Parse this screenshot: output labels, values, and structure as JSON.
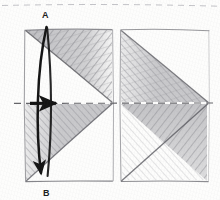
{
  "figure": {
    "kind": "pencil-sketch-fold-diagram",
    "title_visible": false,
    "background_color": "#fdfdfc",
    "ink_color": "#1d1d1d",
    "pencil_shade_color": "#8e8e93",
    "paper_texture": "graph-paper-pencil"
  },
  "labels": {
    "vertex_a": "A",
    "vertex_b": "B"
  },
  "shapes": {
    "left_square": {
      "name": "left-square",
      "x": 24,
      "y": 29,
      "width": 89,
      "height": 153,
      "diagonals": [
        "top-left-to-mid-right",
        "mid-right-to-bottom-left"
      ],
      "shaded_regions": [
        "upper-right-triangle",
        "lower-left-wedge"
      ]
    },
    "right_square": {
      "name": "right-square",
      "x": 120,
      "y": 29,
      "width": 89,
      "height": 153,
      "diagonals": [
        "top-left-to-mid-right",
        "mid-right-to-bottom-left"
      ],
      "shaded_regions": [
        "upper-left-triangle",
        "lower-right-triangle"
      ]
    }
  },
  "guides": {
    "top_dashed_line": {
      "y": 5,
      "style": "dashed"
    },
    "center_dashed_line": {
      "y": 103,
      "style": "dashed"
    }
  },
  "arrows": {
    "fold_arrow": {
      "name": "curved-fold-arrow",
      "from": "A",
      "to": "B",
      "style": "curved-solid-arrow",
      "direction": "downward"
    },
    "direction_arrow": {
      "name": "right-pointing-arrow",
      "style": "straight-solid-arrow",
      "direction": "right",
      "x": 30,
      "y": 103,
      "length": 28
    }
  }
}
